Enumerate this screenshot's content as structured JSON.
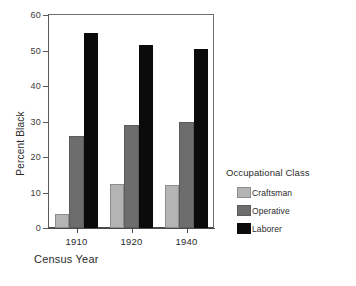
{
  "chart_data": {
    "type": "bar",
    "title": "",
    "subtitle": "",
    "xlabel": "Census Year",
    "ylabel": "Percent Black",
    "categories": [
      "1910",
      "1920",
      "1940"
    ],
    "series": [
      {
        "name": "Craftsman",
        "values": [
          4,
          12.5,
          12
        ],
        "color": "#b4b4b4"
      },
      {
        "name": "Operative",
        "values": [
          26,
          29,
          30
        ],
        "color": "#6d6d6d"
      },
      {
        "name": "Laborer",
        "values": [
          55,
          51.5,
          50.5
        ],
        "color": "#0b0b0b"
      }
    ],
    "ylim": [
      0,
      60
    ],
    "yticks": [
      0,
      10,
      20,
      30,
      40,
      50,
      60
    ],
    "ytick_labels": [
      "0",
      "10",
      "20",
      "30",
      "40",
      "50",
      "60"
    ],
    "grid": false,
    "legend": {
      "title": "Occupational Class",
      "position": "right",
      "entries": [
        "Craftsman",
        "Operative",
        "Laborer"
      ]
    }
  },
  "axes": {
    "y_title": "Percent Black",
    "x_title": "Census Year",
    "y_ticks": [
      "60",
      "50",
      "40",
      "30",
      "20",
      "10",
      "0"
    ],
    "x_ticks": [
      "1910",
      "1920",
      "1940"
    ]
  },
  "legend": {
    "title": "Occupational Class",
    "items": [
      {
        "label": "Craftsman"
      },
      {
        "label": "Operative"
      },
      {
        "label": "Laborer"
      }
    ]
  }
}
